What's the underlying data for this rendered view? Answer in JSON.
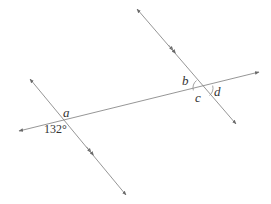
{
  "diagram": {
    "colors": {
      "line": "#8a8a8a",
      "text": "#333333",
      "background": "#ffffff"
    },
    "lines": [
      {
        "id": "left-parallel",
        "from": [
          30,
          79
        ],
        "to": [
          126,
          195
        ],
        "parallel_marker": [
          90,
          151
        ]
      },
      {
        "id": "right-parallel",
        "from": [
          137,
          9
        ],
        "to": [
          236,
          124
        ],
        "parallel_marker": [
          172,
          49
        ]
      },
      {
        "id": "transversal",
        "from": [
          19,
          131
        ],
        "to": [
          259,
          72
        ]
      }
    ],
    "intersections": [
      {
        "id": "left",
        "point": [
          62,
          118
        ]
      },
      {
        "id": "right",
        "point": [
          203,
          88
        ]
      }
    ],
    "labels": {
      "a": "a",
      "given_angle": "132°",
      "b": "b",
      "c": "c",
      "d": "d"
    }
  }
}
